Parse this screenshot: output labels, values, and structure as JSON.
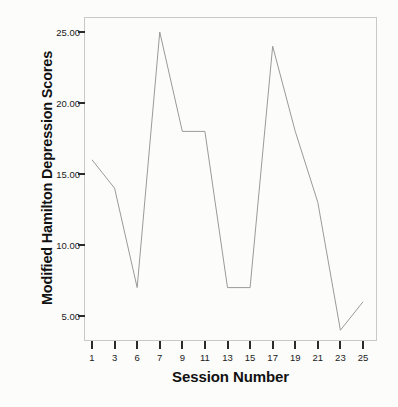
{
  "chart_data": {
    "type": "line",
    "title": "",
    "xlabel": "Session Number",
    "ylabel": "Modified Hamilton Depression Scores",
    "x": [
      1,
      3,
      6,
      7,
      9,
      11,
      13,
      15,
      17,
      19,
      21,
      23,
      25
    ],
    "x_tick_labels": [
      "1",
      "3",
      "6",
      "7",
      "9",
      "11",
      "13",
      "15",
      "17",
      "19",
      "21",
      "23",
      "25"
    ],
    "values": [
      16,
      14,
      7,
      25,
      18,
      18,
      7,
      7,
      24,
      18,
      13,
      4,
      6
    ],
    "y_tick_labels": [
      "25.00",
      "20.00",
      "15.00",
      "10.00",
      "5.00"
    ],
    "y_tick_values": [
      25,
      20,
      15,
      10,
      5
    ],
    "ylim": [
      2.5,
      26
    ],
    "xlim_index": [
      0,
      12
    ],
    "grid": false,
    "legend": null,
    "series_color": "#9a9a9a",
    "frame_color": "#c9c9c9",
    "text_color": "#111111",
    "background": "#fcfcfb"
  },
  "axes": {
    "y_title": "Modified Hamilton Depression Scores",
    "x_title": "Session Number"
  }
}
